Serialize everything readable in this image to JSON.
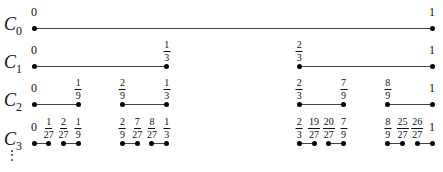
{
  "x_range": [
    0,
    1
  ],
  "rows": [
    {
      "label": "C",
      "sub": "0",
      "intervals": [
        [
          0,
          1
        ]
      ],
      "labels": [
        {
          "v": 0,
          "t": "0"
        },
        {
          "v": 1,
          "t": "1"
        }
      ]
    },
    {
      "label": "C",
      "sub": "1",
      "intervals": [
        [
          0,
          0.3333
        ],
        [
          0.6667,
          1
        ]
      ],
      "labels": [
        {
          "v": 0,
          "t": "0"
        },
        {
          "v": 0.3333,
          "n": "1",
          "d": "3"
        },
        {
          "v": 0.6667,
          "n": "2",
          "d": "3"
        },
        {
          "v": 1,
          "t": "1"
        }
      ]
    },
    {
      "label": "C",
      "sub": "2",
      "intervals": [
        [
          0,
          0.1111
        ],
        [
          0.2222,
          0.3333
        ],
        [
          0.6667,
          0.7778
        ],
        [
          0.8889,
          1
        ]
      ],
      "labels": [
        {
          "v": 0,
          "t": "0"
        },
        {
          "v": 0.1111,
          "n": "1",
          "d": "9"
        },
        {
          "v": 0.2222,
          "n": "2",
          "d": "9"
        },
        {
          "v": 0.3333,
          "n": "1",
          "d": "3"
        },
        {
          "v": 0.6667,
          "n": "2",
          "d": "3"
        },
        {
          "v": 0.7778,
          "n": "7",
          "d": "9"
        },
        {
          "v": 0.8889,
          "n": "8",
          "d": "9"
        },
        {
          "v": 1,
          "t": "1"
        }
      ]
    },
    {
      "label": "C",
      "sub": "3",
      "intervals": [
        [
          0,
          0.037
        ],
        [
          0.0741,
          0.1111
        ],
        [
          0.2222,
          0.2593
        ],
        [
          0.2963,
          0.3333
        ],
        [
          0.6667,
          0.7037
        ],
        [
          0.7407,
          0.7778
        ],
        [
          0.8889,
          0.9259
        ],
        [
          0.963,
          1
        ]
      ],
      "labels": [
        {
          "v": 0,
          "t": "0"
        },
        {
          "v": 0.037,
          "n": "1",
          "d": "27"
        },
        {
          "v": 0.0741,
          "n": "2",
          "d": "27"
        },
        {
          "v": 0.1111,
          "n": "1",
          "d": "9"
        },
        {
          "v": 0.2222,
          "n": "2",
          "d": "9"
        },
        {
          "v": 0.2593,
          "n": "7",
          "d": "27"
        },
        {
          "v": 0.2963,
          "n": "8",
          "d": "27"
        },
        {
          "v": 0.3333,
          "n": "1",
          "d": "3"
        },
        {
          "v": 0.6667,
          "n": "2",
          "d": "3"
        },
        {
          "v": 0.7037,
          "n": "19",
          "d": "27"
        },
        {
          "v": 0.7407,
          "n": "20",
          "d": "27"
        },
        {
          "v": 0.7778,
          "n": "7",
          "d": "9"
        },
        {
          "v": 0.8889,
          "n": "8",
          "d": "9"
        },
        {
          "v": 0.9259,
          "n": "25",
          "d": "27"
        },
        {
          "v": 0.963,
          "n": "26",
          "d": "27"
        },
        {
          "v": 1,
          "t": "1"
        }
      ]
    }
  ],
  "continuation": "⋮",
  "colors": {
    "line": "#444444",
    "dot": "#000000",
    "text": "#111111"
  }
}
